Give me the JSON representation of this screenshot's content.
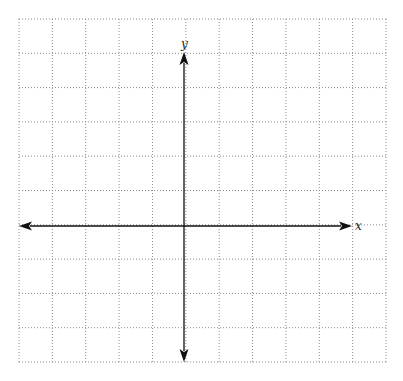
{
  "diagram": {
    "type": "coordinate-plane",
    "grid": {
      "left": 19,
      "top": 19,
      "right": 386,
      "bottom": 362,
      "columns": 11,
      "rows": 10,
      "line_style": "dotted",
      "line_color": "#8a8a8a"
    },
    "axes": {
      "color": "#111111",
      "x_axis": {
        "label": "x",
        "y": 226,
        "x_start": 19,
        "x_end": 352,
        "arrows": "both"
      },
      "y_axis": {
        "label": "y",
        "x": 184,
        "y_start": 52,
        "y_end": 362,
        "arrows": "both"
      }
    }
  }
}
